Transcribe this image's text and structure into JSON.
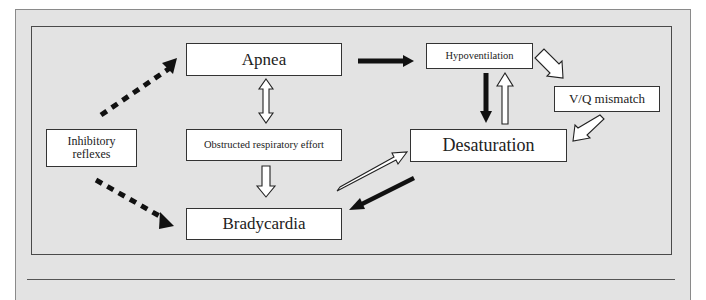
{
  "diagram": {
    "nodes": {
      "apnea": "Apnea",
      "hypoventilation": "Hypoventilation",
      "vq_mismatch": "V/Q mismatch",
      "desaturation": "Desaturation",
      "obstructed": "Obstructed respiratory effort",
      "bradycardia": "Bradycardia",
      "inhibitory": "Inhibitory\nreflexes"
    },
    "edges": [
      {
        "from": "Inhibitory reflexes",
        "to": "Apnea",
        "style": "dotted-bold"
      },
      {
        "from": "Inhibitory reflexes",
        "to": "Bradycardia",
        "style": "dotted-bold"
      },
      {
        "from": "Apnea",
        "to": "Hypoventilation",
        "style": "solid-black"
      },
      {
        "from": "Apnea",
        "to": "Obstructed respiratory effort",
        "style": "hollow-bidirectional"
      },
      {
        "from": "Obstructed respiratory effort",
        "to": "Bradycardia",
        "style": "hollow"
      },
      {
        "from": "Hypoventilation",
        "to": "Desaturation",
        "style": "solid-black"
      },
      {
        "from": "Desaturation",
        "to": "Hypoventilation",
        "style": "hollow"
      },
      {
        "from": "Hypoventilation",
        "to": "V/Q mismatch",
        "style": "hollow"
      },
      {
        "from": "V/Q mismatch",
        "to": "Desaturation",
        "style": "hollow"
      },
      {
        "from": "Bradycardia",
        "to": "Desaturation",
        "style": "hollow"
      },
      {
        "from": "Desaturation",
        "to": "Bradycardia",
        "style": "solid-black"
      }
    ],
    "colors": {
      "paper": "#e3e3e3",
      "box": "#ffffff",
      "stroke": "#222222"
    }
  }
}
